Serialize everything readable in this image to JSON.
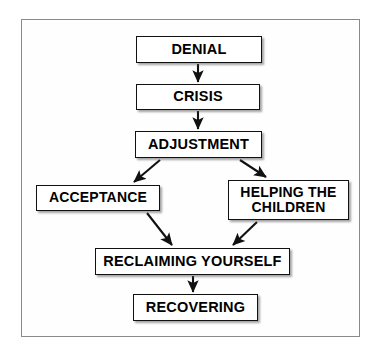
{
  "diagram": {
    "type": "flowchart",
    "title": "",
    "frame": {
      "border_color": "#8a8a8a",
      "background": "#fefefe"
    },
    "node_style": {
      "fill": "#ffffff",
      "border_color": "#111111",
      "text_color": "#000000"
    },
    "connector_color": "#111111",
    "nodes": [
      {
        "id": "denial",
        "label": "DENIAL"
      },
      {
        "id": "crisis",
        "label": "CRISIS"
      },
      {
        "id": "adjustment",
        "label": "ADJUSTMENT"
      },
      {
        "id": "acceptance",
        "label": "ACCEPTANCE"
      },
      {
        "id": "helping",
        "label": "HELPING THE\nCHILDREN"
      },
      {
        "id": "reclaiming",
        "label": "RECLAIMING YOURSELF"
      },
      {
        "id": "recovering",
        "label": "RECOVERING"
      }
    ],
    "edges": [
      {
        "from": "denial",
        "to": "crisis",
        "style": "vertical-arrow"
      },
      {
        "from": "crisis",
        "to": "adjustment",
        "style": "vertical-arrow"
      },
      {
        "from": "adjustment",
        "to": "acceptance",
        "style": "diagonal-arrow-left"
      },
      {
        "from": "adjustment",
        "to": "helping",
        "style": "diagonal-arrow-right"
      },
      {
        "from": "acceptance",
        "to": "reclaiming",
        "style": "diagonal-arrow-right"
      },
      {
        "from": "helping",
        "to": "reclaiming",
        "style": "diagonal-arrow-left"
      },
      {
        "from": "reclaiming",
        "to": "recovering",
        "style": "vertical-arrow"
      }
    ]
  }
}
